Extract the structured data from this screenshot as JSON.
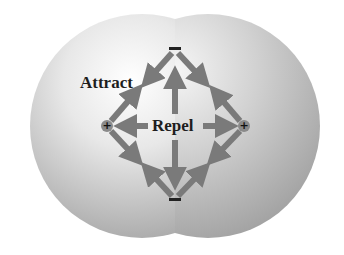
{
  "diagram": {
    "type": "molecular-force-diagram",
    "labels": {
      "attract": "Attract",
      "repel": "Repel"
    },
    "charges": [
      {
        "id": "top-electron",
        "symbol": "−",
        "sign": "negative",
        "x": 175,
        "y": 49
      },
      {
        "id": "bottom-electron",
        "symbol": "−",
        "sign": "negative",
        "x": 175,
        "y": 200
      },
      {
        "id": "left-nucleus",
        "symbol": "+",
        "sign": "positive",
        "x": 107,
        "y": 126
      },
      {
        "id": "right-nucleus",
        "symbol": "+",
        "sign": "positive",
        "x": 244,
        "y": 126
      }
    ],
    "forces": [
      {
        "type": "attract",
        "between": [
          "top-electron",
          "left-nucleus"
        ]
      },
      {
        "type": "attract",
        "between": [
          "top-electron",
          "right-nucleus"
        ]
      },
      {
        "type": "attract",
        "between": [
          "bottom-electron",
          "left-nucleus"
        ]
      },
      {
        "type": "attract",
        "between": [
          "bottom-electron",
          "right-nucleus"
        ]
      },
      {
        "type": "repel",
        "between": [
          "left-nucleus",
          "right-nucleus"
        ]
      },
      {
        "type": "repel",
        "between": [
          "top-electron",
          "bottom-electron"
        ]
      }
    ],
    "colors": {
      "background": "#ffffff",
      "arrow": "#7a7a7a",
      "text": "#1e1e1e",
      "sphere_light": "#f4f4f4",
      "sphere_dark": "#a9a9a9"
    }
  }
}
